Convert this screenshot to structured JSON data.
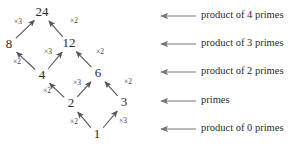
{
  "diagram": {
    "nodes": [
      {
        "id": "n24",
        "label": "24",
        "x": 42,
        "y": 13
      },
      {
        "id": "n8",
        "label": "8",
        "x": 9,
        "y": 45
      },
      {
        "id": "n12",
        "label": "12",
        "x": 69,
        "y": 44
      },
      {
        "id": "n4",
        "label": "4",
        "x": 42,
        "y": 76
      },
      {
        "id": "n6",
        "label": "6",
        "x": 98,
        "y": 74
      },
      {
        "id": "n2",
        "label": "2",
        "x": 71,
        "y": 104
      },
      {
        "id": "n3",
        "label": "3",
        "x": 124,
        "y": 103
      },
      {
        "id": "n1",
        "label": "1",
        "x": 97,
        "y": 135
      }
    ],
    "edges": [
      {
        "id": "e-8-24",
        "from": "n8",
        "to": "n24",
        "label": "×3",
        "lx": 18,
        "ly": 22
      },
      {
        "id": "e-12-24",
        "from": "n12",
        "to": "n24",
        "label": "×2",
        "lx": 74,
        "ly": 21
      },
      {
        "id": "e-4-8",
        "from": "n4",
        "to": "n8",
        "label": "×2",
        "lx": 17,
        "ly": 62
      },
      {
        "id": "e-4-12",
        "from": "n4",
        "to": "n12",
        "label": "×3",
        "lx": 48,
        "ly": 52
      },
      {
        "id": "e-6-12",
        "from": "n6",
        "to": "n12",
        "label": "×2",
        "lx": 100,
        "ly": 52
      },
      {
        "id": "e-2-4",
        "from": "n2",
        "to": "n4",
        "label": "×2",
        "lx": 47,
        "ly": 91
      },
      {
        "id": "e-2-6",
        "from": "n2",
        "to": "n6",
        "label": "×3",
        "lx": 77,
        "ly": 83
      },
      {
        "id": "e-3-6",
        "from": "n3",
        "to": "n6",
        "label": "×2",
        "lx": 128,
        "ly": 82
      },
      {
        "id": "e-1-2",
        "from": "n1",
        "to": "n2",
        "label": "×2",
        "lx": 74,
        "ly": 122
      },
      {
        "id": "e-1-3",
        "from": "n1",
        "to": "n3",
        "label": "×3",
        "lx": 123,
        "ly": 121
      }
    ]
  },
  "legend": {
    "arrow_tip_x": 161,
    "arrow_tail_x": 196,
    "text_x": 201,
    "rows": [
      {
        "id": "lvl4",
        "label": "product of 4 primes",
        "y": 16
      },
      {
        "id": "lvl3",
        "label": "product of 3 primes",
        "y": 44
      },
      {
        "id": "lvl2",
        "label": "product of 2 primes",
        "y": 72
      },
      {
        "id": "lvl1",
        "label": "primes",
        "y": 101
      },
      {
        "id": "lvl0",
        "label": "product of 0 primes",
        "y": 129
      }
    ]
  },
  "colors": {
    "background": "#ffffff",
    "node_text": "#2b2b2b",
    "edge": "#555555",
    "legend_line": "#777777",
    "legend_text": "#2b2b2b"
  }
}
